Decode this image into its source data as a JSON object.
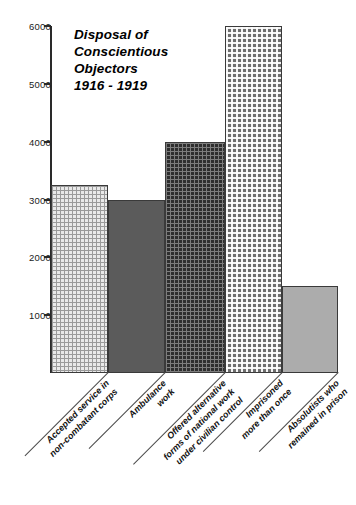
{
  "chart_data": {
    "type": "bar",
    "title_lines": [
      "Disposal of",
      "Conscientious",
      "Objectors",
      "1916 - 1919"
    ],
    "xlabel": "",
    "ylabel": "",
    "ylim": [
      0,
      6000
    ],
    "yticks": [
      1000,
      2000,
      3000,
      4000,
      5000,
      6000
    ],
    "ytick_labels": [
      "1000",
      "2000",
      "3000",
      "4000",
      "5000",
      "6000"
    ],
    "grid": false,
    "legend": "none",
    "categories": [
      "Accepted service in non-combatant corps",
      "Ambulance work",
      "Offered alternative forms of national work under civilian control",
      "Imprisoned more than once",
      "Absolutists who remained in prison"
    ],
    "category_lines": [
      [
        "Accepted service in",
        "non-combatant corps"
      ],
      [
        "Ambulance",
        "work"
      ],
      [
        "Offered alternative",
        "forms of national work",
        "under civilian control"
      ],
      [
        "Imprisoned",
        "more than once"
      ],
      [
        "Absolutists who",
        "remained in prison"
      ]
    ],
    "values": [
      3250,
      3000,
      4000,
      6000,
      1500
    ],
    "bar_textures": [
      "light-grid",
      "solid-dark-gray",
      "dark-grid",
      "dotted",
      "solid-light-gray"
    ],
    "bar_colors": [
      "#e9e9e9",
      "#5b5b5b",
      "#2e2e2e",
      "#6e6e6e",
      "#acacac"
    ],
    "axis_color": "#2a2a2a",
    "background_color": "#ffffff"
  }
}
